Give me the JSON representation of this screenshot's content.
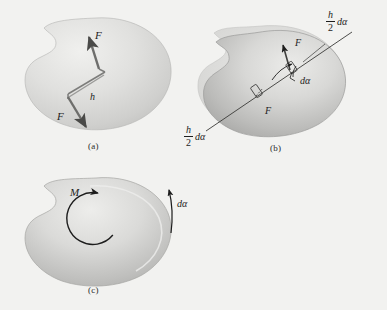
{
  "figure": {
    "background_color": "#f2f2f0",
    "body_fill_light": "#e3e3e1",
    "body_fill_mid": "#c9c9c7",
    "body_fill_dark": "#a8a8a6",
    "ink_color": "#1d1d1d"
  },
  "panels": {
    "a": {
      "caption": "(a)",
      "force_top_label": "F",
      "force_bottom_label": "F",
      "distance_label": "h"
    },
    "b": {
      "caption": "(b)",
      "force_top_label": "F",
      "force_bottom_label": "F",
      "angle_label": "dα",
      "displacement_top": {
        "numerator": "h",
        "denominator": "2",
        "suffix": "dα"
      },
      "displacement_bottom": {
        "numerator": "h",
        "denominator": "2",
        "suffix": "dα"
      }
    },
    "c": {
      "caption": "(c)",
      "moment_label": "M",
      "rotation_label": "dα"
    }
  }
}
